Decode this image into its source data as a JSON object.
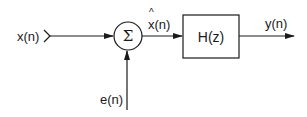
{
  "diagram": {
    "type": "block-diagram",
    "colors": {
      "stroke": "#1a1a1a",
      "background": "#ffffff"
    },
    "nodes": [
      {
        "id": "input",
        "label": "x(n)"
      },
      {
        "id": "sum",
        "symbol": "Σ"
      },
      {
        "id": "noise",
        "label": "e(n)"
      },
      {
        "id": "filter",
        "label": "H(z)"
      },
      {
        "id": "output",
        "label": "y(n)"
      }
    ],
    "edges": [
      {
        "from": "input",
        "to": "sum",
        "label": ""
      },
      {
        "from": "noise",
        "to": "sum",
        "label": ""
      },
      {
        "from": "sum",
        "to": "filter",
        "label": "x(n)",
        "hat": "^"
      },
      {
        "from": "filter",
        "to": "output",
        "label": "y(n)"
      }
    ]
  },
  "labels": {
    "input": "x(n)",
    "sum_symbol": "Σ",
    "noise": "e(n)",
    "intermediate": "x(n)",
    "intermediate_hat": "^",
    "filter": "H(z)",
    "output": "y(n)"
  }
}
